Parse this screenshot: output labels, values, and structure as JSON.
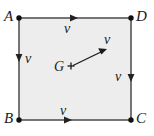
{
  "figure": {
    "shape": "square",
    "fill_color": "#ededed",
    "edge_color": "#4a4a4a",
    "ink_color": "#1a1a1a",
    "vertices": [
      {
        "name": "A",
        "label": "A",
        "position": "top-left"
      },
      {
        "name": "D",
        "label": "D",
        "position": "top-right"
      },
      {
        "name": "B",
        "label": "B",
        "position": "bottom-left"
      },
      {
        "name": "C",
        "label": "C",
        "position": "bottom-right"
      }
    ],
    "centroid": {
      "label": "G",
      "marker": "plus-cross",
      "vector_label": "v",
      "vector_direction": "up-right"
    },
    "edge_vectors": [
      {
        "edge": "AD",
        "label": "v",
        "direction": "right"
      },
      {
        "edge": "AB",
        "label": "v",
        "direction": "down"
      },
      {
        "edge": "DC",
        "label": "v",
        "direction": "down"
      },
      {
        "edge": "BC",
        "label": "v",
        "direction": "right"
      }
    ]
  }
}
